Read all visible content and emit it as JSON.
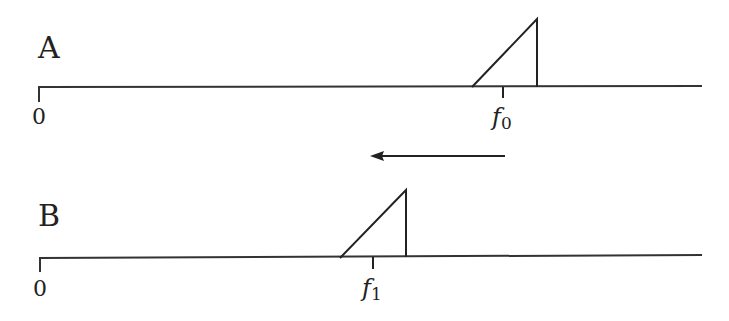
{
  "diagram": {
    "panel_a": {
      "label": "A",
      "origin_label": "0",
      "freq_label": "f",
      "freq_subscript": "0"
    },
    "panel_b": {
      "label": "B",
      "origin_label": "0",
      "freq_label": "f",
      "freq_subscript": "1"
    },
    "arrow": {
      "direction": "left"
    },
    "colors": {
      "stroke": "#222222",
      "background": "#ffffff"
    }
  }
}
